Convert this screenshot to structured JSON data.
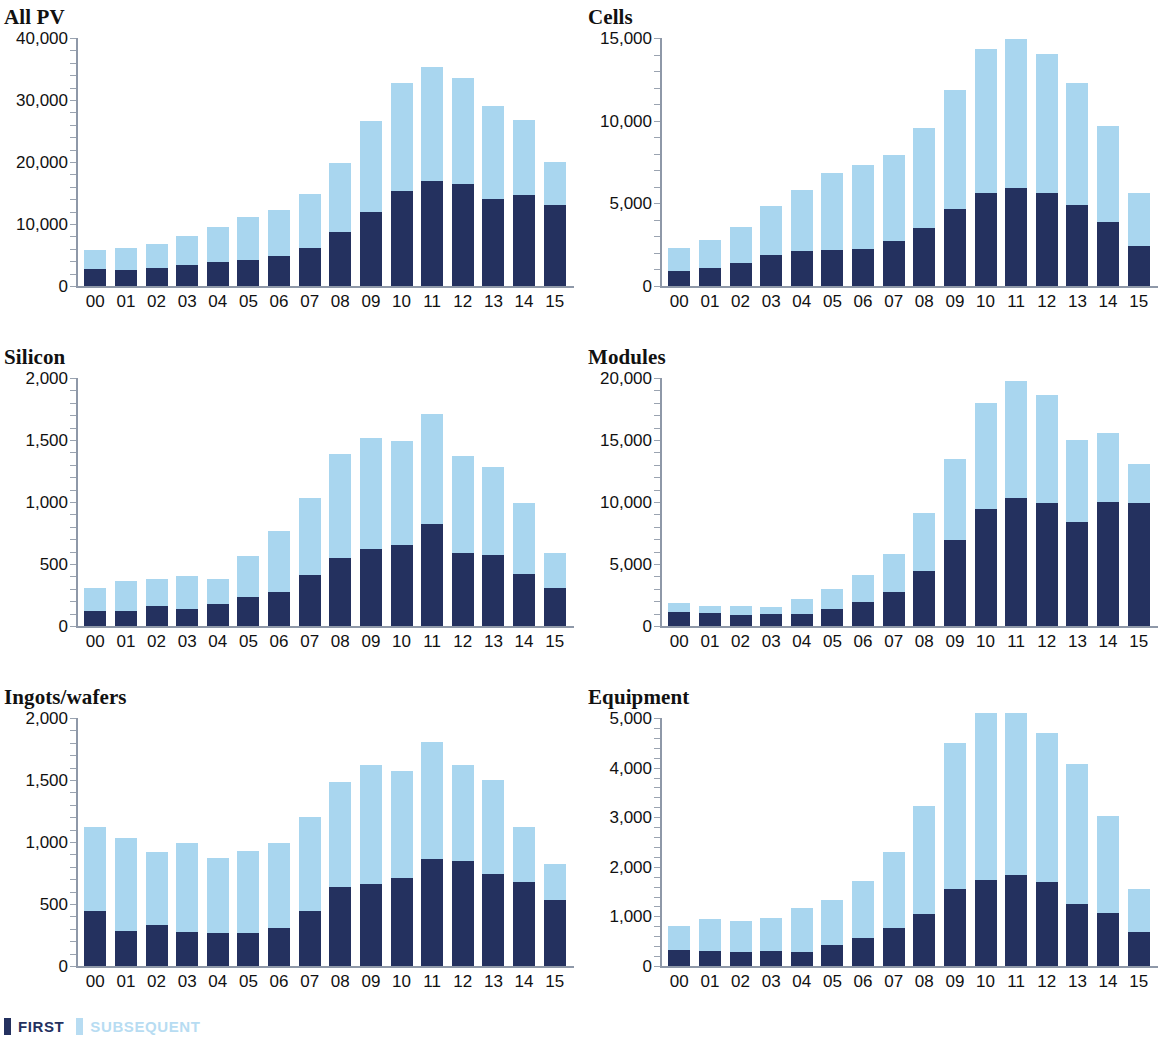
{
  "legend": {
    "items": [
      {
        "label": "FIRST",
        "color": "#24315f"
      },
      {
        "label": "SUBSEQUENT",
        "color": "#b7dcf2"
      }
    ]
  },
  "colors": {
    "first": "#24315f",
    "subsequent": "#a9d6ef",
    "axis": "#8e98a8",
    "text": "#111111",
    "background": "#ffffff"
  },
  "chart_data": [
    {
      "type": "bar",
      "stacked": true,
      "title": "All PV",
      "xlabel": "",
      "ylabel": "",
      "ylim": [
        0,
        40000
      ],
      "yticks": [
        0,
        10000,
        20000,
        30000,
        40000
      ],
      "yticklabels": [
        "0",
        "10,000",
        "20,000",
        "30,000",
        "40,000"
      ],
      "grid": false,
      "legend_position": "figure-bottom-left",
      "categories": [
        "00",
        "01",
        "02",
        "03",
        "04",
        "05",
        "06",
        "07",
        "08",
        "09",
        "10",
        "11",
        "12",
        "13",
        "14",
        "15"
      ],
      "series": [
        {
          "name": "FIRST",
          "color": "#24315f",
          "values": [
            2700,
            2600,
            2900,
            3400,
            3800,
            4200,
            4800,
            6200,
            8700,
            11900,
            15400,
            17000,
            16400,
            14100,
            14700,
            13100
          ]
        },
        {
          "name": "SUBSEQUENT",
          "color": "#a9d6ef",
          "values": [
            3100,
            3500,
            3800,
            4700,
            5700,
            6900,
            7400,
            8600,
            11200,
            14700,
            17400,
            18400,
            17200,
            14900,
            12100,
            6900
          ]
        }
      ],
      "totals": [
        5800,
        6100,
        6700,
        8100,
        9500,
        11100,
        12200,
        14800,
        19900,
        26600,
        32800,
        35400,
        33600,
        29000,
        26800,
        20000
      ]
    },
    {
      "type": "bar",
      "stacked": true,
      "title": "Cells",
      "xlabel": "",
      "ylabel": "",
      "ylim": [
        0,
        15000
      ],
      "yticks": [
        0,
        5000,
        10000,
        15000
      ],
      "yticklabels": [
        "0",
        "5,000",
        "10,000",
        "15,000"
      ],
      "grid": false,
      "legend_position": "figure-bottom-left",
      "categories": [
        "00",
        "01",
        "02",
        "03",
        "04",
        "05",
        "06",
        "07",
        "08",
        "09",
        "10",
        "11",
        "12",
        "13",
        "14",
        "15"
      ],
      "series": [
        {
          "name": "FIRST",
          "color": "#24315f",
          "values": [
            900,
            1100,
            1400,
            1900,
            2100,
            2200,
            2250,
            2750,
            3500,
            4650,
            5650,
            5950,
            5600,
            4900,
            3850,
            2450
          ]
        },
        {
          "name": "SUBSEQUENT",
          "color": "#a9d6ef",
          "values": [
            1400,
            1700,
            2200,
            2950,
            3700,
            4650,
            5100,
            5200,
            6050,
            7200,
            8700,
            9000,
            8450,
            7350,
            5850,
            3200
          ]
        }
      ],
      "totals": [
        2300,
        2800,
        3600,
        4850,
        5800,
        6850,
        7350,
        7950,
        9550,
        11850,
        14350,
        14950,
        14050,
        12250,
        9700,
        5650
      ]
    },
    {
      "type": "bar",
      "stacked": true,
      "title": "Silicon",
      "xlabel": "",
      "ylabel": "",
      "ylim": [
        0,
        2000
      ],
      "yticks": [
        0,
        500,
        1000,
        1500,
        2000
      ],
      "yticklabels": [
        "0",
        "500",
        "1,000",
        "1,500",
        "2,000"
      ],
      "grid": false,
      "legend_position": "figure-bottom-left",
      "categories": [
        "00",
        "01",
        "02",
        "03",
        "04",
        "05",
        "06",
        "07",
        "08",
        "09",
        "10",
        "11",
        "12",
        "13",
        "14",
        "15"
      ],
      "series": [
        {
          "name": "FIRST",
          "color": "#24315f",
          "values": [
            120,
            125,
            165,
            140,
            175,
            230,
            275,
            415,
            550,
            625,
            650,
            820,
            590,
            570,
            420,
            310
          ]
        },
        {
          "name": "SUBSEQUENT",
          "color": "#a9d6ef",
          "values": [
            185,
            235,
            215,
            265,
            205,
            335,
            490,
            615,
            840,
            890,
            840,
            890,
            780,
            710,
            575,
            280
          ]
        }
      ],
      "totals": [
        305,
        360,
        380,
        405,
        380,
        565,
        765,
        1030,
        1390,
        1515,
        1490,
        1710,
        1370,
        1280,
        995,
        590
      ]
    },
    {
      "type": "bar",
      "stacked": true,
      "title": "Modules",
      "xlabel": "",
      "ylabel": "",
      "ylim": [
        0,
        20000
      ],
      "yticks": [
        0,
        5000,
        10000,
        15000,
        20000
      ],
      "yticklabels": [
        "0",
        "5,000",
        "10,000",
        "15,000",
        "20,000"
      ],
      "grid": false,
      "legend_position": "figure-bottom-left",
      "categories": [
        "00",
        "01",
        "02",
        "03",
        "04",
        "05",
        "06",
        "07",
        "08",
        "09",
        "10",
        "11",
        "12",
        "13",
        "14",
        "15"
      ],
      "series": [
        {
          "name": "FIRST",
          "color": "#24315f",
          "values": [
            1150,
            1050,
            900,
            950,
            1000,
            1350,
            1950,
            2750,
            4450,
            6950,
            9450,
            10300,
            9900,
            8350,
            10000,
            9900
          ]
        },
        {
          "name": "SUBSEQUENT",
          "color": "#a9d6ef",
          "values": [
            700,
            550,
            700,
            600,
            1200,
            1600,
            2200,
            3050,
            4650,
            6550,
            8500,
            9450,
            8750,
            6650,
            5600,
            3200
          ]
        }
      ],
      "totals": [
        1850,
        1600,
        1600,
        1550,
        2200,
        2950,
        4150,
        5800,
        9100,
        13500,
        17950,
        19750,
        18650,
        15000,
        15600,
        13100
      ]
    },
    {
      "type": "bar",
      "stacked": true,
      "title": "Ingots/wafers",
      "xlabel": "",
      "ylabel": "",
      "ylim": [
        0,
        2000
      ],
      "yticks": [
        0,
        500,
        1000,
        1500,
        2000
      ],
      "yticklabels": [
        "0",
        "500",
        "1,000",
        "1,500",
        "2,000"
      ],
      "grid": false,
      "legend_position": "figure-bottom-left",
      "categories": [
        "00",
        "01",
        "02",
        "03",
        "04",
        "05",
        "06",
        "07",
        "08",
        "09",
        "10",
        "11",
        "12",
        "13",
        "14",
        "15"
      ],
      "series": [
        {
          "name": "FIRST",
          "color": "#24315f",
          "values": [
            440,
            280,
            330,
            275,
            265,
            265,
            305,
            440,
            640,
            665,
            710,
            860,
            845,
            740,
            680,
            530
          ]
        },
        {
          "name": "SUBSEQUENT",
          "color": "#a9d6ef",
          "values": [
            685,
            750,
            590,
            720,
            605,
            660,
            685,
            765,
            845,
            955,
            865,
            945,
            775,
            760,
            445,
            290
          ]
        }
      ],
      "totals": [
        1125,
        1030,
        920,
        995,
        870,
        925,
        990,
        1205,
        1485,
        1620,
        1575,
        1805,
        1620,
        1500,
        1125,
        820
      ]
    },
    {
      "type": "bar",
      "stacked": true,
      "title": "Equipment",
      "xlabel": "",
      "ylabel": "",
      "ylim": [
        0,
        5000
      ],
      "yticks": [
        0,
        1000,
        2000,
        3000,
        4000,
        5000
      ],
      "yticklabels": [
        "0",
        "1,000",
        "2,000",
        "3,000",
        "4,000",
        "5,000"
      ],
      "grid": false,
      "legend_position": "figure-bottom-left",
      "categories": [
        "00",
        "01",
        "02",
        "03",
        "04",
        "05",
        "06",
        "07",
        "08",
        "09",
        "10",
        "11",
        "12",
        "13",
        "14",
        "15"
      ],
      "series": [
        {
          "name": "FIRST",
          "color": "#24315f",
          "values": [
            330,
            300,
            280,
            310,
            280,
            430,
            560,
            760,
            1040,
            1560,
            1740,
            1840,
            1690,
            1260,
            1070,
            680
          ]
        },
        {
          "name": "SUBSEQUENT",
          "color": "#a9d6ef",
          "values": [
            480,
            640,
            620,
            660,
            890,
            910,
            1150,
            1540,
            2180,
            2940,
            3360,
            3260,
            3010,
            2820,
            1960,
            870
          ]
        }
      ],
      "totals": [
        810,
        940,
        900,
        970,
        1170,
        1340,
        1710,
        2300,
        3220,
        4500,
        5100,
        5100,
        4700,
        4080,
        3030,
        1550
      ]
    }
  ]
}
